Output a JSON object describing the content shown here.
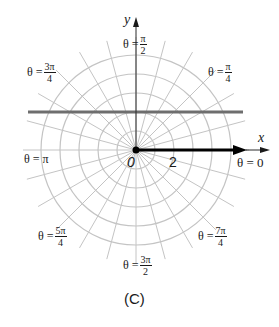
{
  "figure": {
    "caption": "(C)",
    "axes": {
      "x_label": "x",
      "y_label": "y"
    },
    "origin_label": "0",
    "radial_tick_label": "2",
    "angle_labels": {
      "theta_0": {
        "lhs": "θ = 0"
      },
      "theta_pi_4": {
        "lhs": "θ =",
        "num": "π",
        "den": "4"
      },
      "theta_pi_2": {
        "lhs": "θ =",
        "num": "π",
        "den": "2"
      },
      "theta_3pi_4": {
        "lhs": "θ =",
        "num": "3π",
        "den": "4"
      },
      "theta_pi": {
        "lhs": "θ = π"
      },
      "theta_5pi_4": {
        "lhs": "θ =",
        "num": "5π",
        "den": "4"
      },
      "theta_3pi_2": {
        "lhs": "θ =",
        "num": "3π",
        "den": "2"
      },
      "theta_7pi_4": {
        "lhs": "θ =",
        "num": "7π",
        "den": "4"
      }
    },
    "polar_grid": {
      "center": [
        136,
        150
      ],
      "circle_count": 5,
      "circle_spacing_px": 19,
      "ray_count": 24,
      "ray_step": "π/12",
      "grid_color": "#c4c4c4"
    },
    "horizontal_line": {
      "y": 112,
      "x_start": 28,
      "x_end": 243,
      "color": "#6e6e6e"
    },
    "vector": {
      "from": [
        136,
        150
      ],
      "to": [
        245,
        150
      ],
      "color": "#000000"
    }
  }
}
